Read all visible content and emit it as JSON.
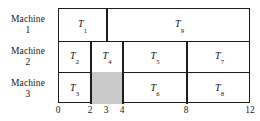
{
  "chart_data": {
    "type": "gantt",
    "title": "",
    "xlabel": "",
    "ylabel": "",
    "xlim": [
      0,
      12
    ],
    "xticks": [
      0,
      2,
      3,
      4,
      8,
      12
    ],
    "xtick_labels": [
      "0",
      "2",
      "3",
      "4",
      "8",
      "12"
    ],
    "grid": false,
    "legend": "none",
    "rows": [
      {
        "label_word": "Machine",
        "label_number": "1",
        "tasks": [
          {
            "name": "T",
            "index": "1",
            "start": 0,
            "end": 3,
            "idle": false
          },
          {
            "name": "T",
            "index": "9",
            "start": 3,
            "end": 12,
            "idle": false
          }
        ]
      },
      {
        "label_word": "Machine",
        "label_number": "2",
        "tasks": [
          {
            "name": "T",
            "index": "2",
            "start": 0,
            "end": 2,
            "idle": false
          },
          {
            "name": "T",
            "index": "4",
            "start": 2,
            "end": 4,
            "idle": false
          },
          {
            "name": "T",
            "index": "5",
            "start": 4,
            "end": 8,
            "idle": false
          },
          {
            "name": "T",
            "index": "7",
            "start": 8,
            "end": 12,
            "idle": false
          }
        ]
      },
      {
        "label_word": "Machine",
        "label_number": "3",
        "tasks": [
          {
            "name": "T",
            "index": "3",
            "start": 0,
            "end": 2,
            "idle": false
          },
          {
            "name": "",
            "index": "",
            "start": 2,
            "end": 4,
            "idle": true
          },
          {
            "name": "T",
            "index": "6",
            "start": 4,
            "end": 8,
            "idle": false
          },
          {
            "name": "T",
            "index": "8",
            "start": 8,
            "end": 12,
            "idle": false
          }
        ]
      }
    ],
    "colors": {
      "border": "#1c1c1c",
      "idle_fill": "#c9c9c9",
      "task_fill": "#ffffff",
      "text": "#111111",
      "background": "#ffffff"
    }
  }
}
